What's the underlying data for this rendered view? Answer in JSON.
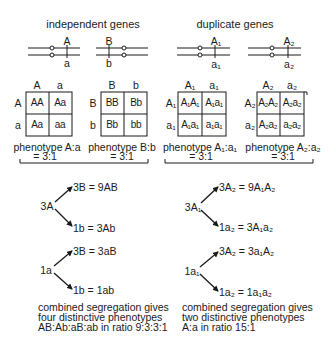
{
  "left": {
    "title": "independent genes",
    "chromosomes": [
      {
        "upper": "A",
        "lower": "a"
      },
      {
        "upper": "B",
        "lower": "b"
      }
    ],
    "grids": [
      {
        "col_headers": [
          "A",
          "a"
        ],
        "row_headers": [
          "A",
          "a"
        ],
        "cells": [
          [
            "AA",
            "Aa"
          ],
          [
            "Aa",
            "aa"
          ]
        ],
        "phenotype": "phenotype A:a",
        "ratio": "= 3:1"
      },
      {
        "col_headers": [
          "B",
          "b"
        ],
        "row_headers": [
          "B",
          "b"
        ],
        "cells": [
          [
            "BB",
            "Bb"
          ],
          [
            "Bb",
            "bb"
          ]
        ],
        "phenotype": "phenotype B:b",
        "ratio": "= 3:1"
      }
    ],
    "tree": [
      {
        "root": "3A",
        "branches": [
          "3B = 9AB",
          "1b = 3Ab"
        ]
      },
      {
        "root": "1a",
        "branches": [
          "3B = 3aB",
          "1b = 1ab"
        ]
      }
    ],
    "summary": [
      "combined segregation gives",
      "four distinctive phenotypes",
      "AB:Ab:aB:ab in ratio 9:3:3:1"
    ]
  },
  "right": {
    "title": "duplicate genes",
    "chromosomes": [
      {
        "upper": "A₁",
        "lower": "a₁"
      },
      {
        "upper": "A₂",
        "lower": "a₂"
      }
    ],
    "grids": [
      {
        "col_headers": [
          "A₁",
          "a₁"
        ],
        "row_headers": [
          "A₁",
          "a₁"
        ],
        "cells": [
          [
            "A₁A₁",
            "A₁a₁"
          ],
          [
            "A₁a₁",
            "a₁a₁"
          ]
        ],
        "phenotype": "phenotype A₁:a₁",
        "ratio": "= 3:1"
      },
      {
        "col_headers": [
          "A₂",
          "a₂"
        ],
        "row_headers": [
          "A₂",
          "a₂"
        ],
        "cells": [
          [
            "A₂A₂",
            "A₂a₂"
          ],
          [
            "A₂a₂",
            "a₂a₂"
          ]
        ],
        "phenotype": "phenotype A₂:a₂",
        "ratio": "= 3:1"
      }
    ],
    "tree": [
      {
        "root": "3A₁",
        "branches": [
          "3A₂ = 9A₁A₂",
          "1a₂ = 3A₁a₂"
        ]
      },
      {
        "root": "1a₁",
        "branches": [
          "3A₂ = 3a₁A₂",
          "1a₂ = 1a₁a₂"
        ]
      }
    ],
    "summary": [
      "combined segregation gives",
      "two distinctive phenotypes",
      "A:a in ratio 15:1"
    ]
  },
  "colors": {
    "ink": "#1a1a1a",
    "background": "#ffffff"
  }
}
